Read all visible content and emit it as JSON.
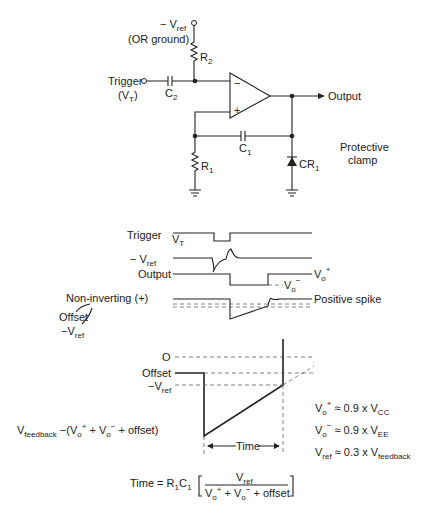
{
  "circuit": {
    "neg_vref_label": "− V",
    "neg_vref_sub": "ref",
    "or_ground_label": "(OR ground)",
    "r2_label": "R",
    "r2_sub": "2",
    "trigger_label": "Trigger",
    "vt_label": "(V",
    "vt_sub": "T",
    "vt_close": ")",
    "c2_label": "C",
    "c2_sub": "2",
    "opamp_minus": "−",
    "opamp_plus": "+",
    "output_label": "Output",
    "c1_label": "C",
    "c1_sub": "1",
    "r1_label": "R",
    "r1_sub": "1",
    "cr1_label": "CR",
    "cr1_sub": "1",
    "clamp_line1": "Protective",
    "clamp_line2": "clamp"
  },
  "timing": {
    "vt_label": "V",
    "vt_sub": "T",
    "trigger_label": "Trigger",
    "neg_vref_label": "− V",
    "neg_vref_sub": "ref",
    "output_label": "Output",
    "vo_plus_label": "V",
    "vo_plus_sub": "o",
    "vo_plus_sup": "+",
    "vo_minus_label": "V",
    "vo_minus_sub": "o",
    "vo_minus_sup": "−",
    "noninv_label": "Non-inverting  (+)",
    "positive_spike_label": "Positive  spike",
    "offset_label": "Offset",
    "offset_neg_vref_label": "−V",
    "offset_neg_vref_sub": "ref"
  },
  "ramp": {
    "zero_label": "O",
    "offset_label": "Offset",
    "neg_vref_label": "−V",
    "neg_vref_sub": "ref",
    "vfeedback_label": "V",
    "vfeedback_sub": "feedback",
    "vfeedback_expr": " −(V",
    "vfeedback_expr_sub1": "o",
    "vfeedback_expr_sup1": "+",
    "vfeedback_expr_mid": " + V",
    "vfeedback_expr_sub2": "o",
    "vfeedback_expr_sup2": "−",
    "vfeedback_expr_end": " + offset)",
    "time_label": "Time"
  },
  "equations": {
    "vo_plus": {
      "lhs": "V",
      "lhs_sub": "o",
      "lhs_sup": "+",
      "rhs": " ≈ 0.9 x V",
      "rhs_sub": "CC"
    },
    "vo_minus": {
      "lhs": "V",
      "lhs_sub": "o",
      "lhs_sup": "−",
      "rhs": " ≈ 0.9 x V",
      "rhs_sub": "EE"
    },
    "vref": {
      "lhs": "V",
      "lhs_sub": "ref",
      "rhs": " ≈ 0.3 x V",
      "rhs_sub": "feedback"
    },
    "time": {
      "lhs": "Time = R",
      "r_sub": "1",
      "c": "C",
      "c_sub": "1",
      "numerator": "V",
      "numerator_sub": "ref",
      "den_a": "V",
      "den_a_sub": "o",
      "den_a_sup": "+",
      "den_mid": " + V",
      "den_b_sub": "o",
      "den_b_sup": "−",
      "den_end": " + offset"
    }
  }
}
